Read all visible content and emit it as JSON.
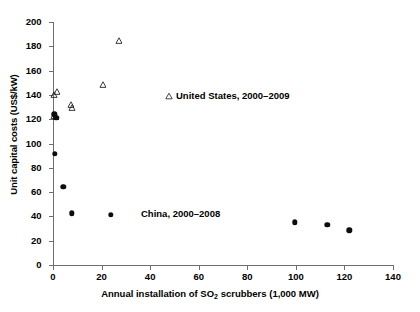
{
  "chart_data": {
    "type": "scatter",
    "title": "",
    "xlabel": "Annual installation of SO2 scrubbers (1,000 MW)",
    "ylabel": "Unit capital costs (US$/kW)",
    "xlim": [
      0,
      140
    ],
    "ylim": [
      0,
      200
    ],
    "xticks": [
      0,
      20,
      40,
      60,
      80,
      100,
      120,
      140
    ],
    "yticks": [
      0,
      20,
      40,
      60,
      80,
      100,
      120,
      140,
      160,
      180,
      200
    ],
    "grid": false,
    "legend_position": "inline-annotation",
    "series": [
      {
        "name": "United States, 2000–2009",
        "marker": "open-triangle",
        "color": "#1a1a1a",
        "points": [
          {
            "x": 0.4,
            "y": 141.0
          },
          {
            "x": 1.5,
            "y": 144.0
          },
          {
            "x": 7.3,
            "y": 133.5
          },
          {
            "x": 8.0,
            "y": 130.5
          },
          {
            "x": 20.5,
            "y": 150.0
          },
          {
            "x": 27.0,
            "y": 186.0
          },
          {
            "x": 0.6,
            "y": 124.5
          },
          {
            "x": 1.1,
            "y": 123.0
          }
        ]
      },
      {
        "name": "China, 2000–2008",
        "marker": "filled-circle",
        "color": "#0d0d0d",
        "points": [
          {
            "x": 0.5,
            "y": 124.0
          },
          {
            "x": 1.3,
            "y": 121.0
          },
          {
            "x": 0.8,
            "y": 91.5
          },
          {
            "x": 4.2,
            "y": 64.5
          },
          {
            "x": 7.8,
            "y": 42.5
          },
          {
            "x": 23.8,
            "y": 41.5
          },
          {
            "x": 99.5,
            "y": 35.0
          },
          {
            "x": 113.0,
            "y": 33.0
          },
          {
            "x": 122.0,
            "y": 28.5
          }
        ]
      }
    ]
  },
  "axes": {
    "x_title_prefix": "Annual installation of SO",
    "x_title_subscript": "2",
    "x_title_suffix": " scrubbers (1,000 MW)",
    "y_title": "Unit capital costs (US$/kW)"
  },
  "annotations": {
    "us_label": "United States, 2000–2009",
    "china_label": "China, 2000–2008"
  }
}
